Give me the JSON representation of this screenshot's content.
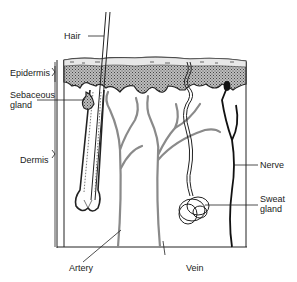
{
  "diagram": {
    "labels": {
      "hair": "Hair",
      "epidermis": "Epidermis",
      "sebaceous_line1": "Sebaceous",
      "sebaceous_line2": "gland",
      "dermis": "Dermis",
      "nerve": "Nerve",
      "sweat_line1": "Sweat",
      "sweat_line2": "gland",
      "artery": "Artery",
      "vein": "Vein"
    },
    "colors": {
      "outline": "#1a1a1a",
      "vessel": "#8a8a8a",
      "epidermis_fill": "#9a9a9a"
    }
  }
}
